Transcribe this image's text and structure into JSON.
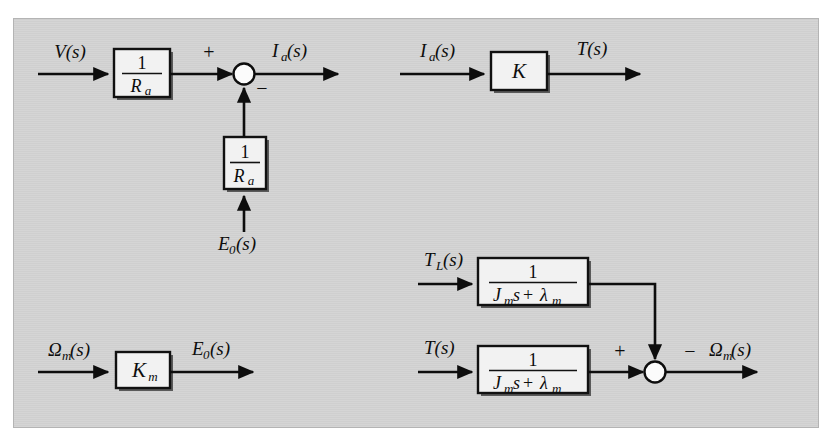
{
  "figure": {
    "type": "block-diagram",
    "domain": "control-systems",
    "background_color": "#d2d2d2",
    "page_color": "#ffffff",
    "line_color": "#0d0d0d",
    "block_fill": "#f2f2f2"
  },
  "subdiagrams": [
    {
      "id": "armature-circuit",
      "input_label": "V(s)",
      "block_label": "1 / R_a",
      "output_label": "I_a(s)",
      "feedback_label": "E_0(s)"
    },
    {
      "id": "torque-gain",
      "input_label": "I_a(s)",
      "block_label": "K",
      "output_label": "T(s)"
    },
    {
      "id": "back-emf",
      "input_label": "Omega_m(s)",
      "block_label": "K_m",
      "output_label": "E_0(s)"
    },
    {
      "id": "mechanical-load",
      "input_label_top": "T_L(s)",
      "input_label_bottom": "T(s)",
      "block_label": "1 / (J_m s + lambda_m)",
      "output_label": "Omega_m(s)"
    }
  ],
  "labels": {
    "v_s": "V(s)",
    "ia_s_out": "I",
    "ia_sub": "a",
    "ia_paren": "(s)",
    "ia_s_in": "I",
    "e0_feedback": "E",
    "e0_sub": "0",
    "e0_paren": "(s)",
    "t_s": "T(s)",
    "tl_main": "T",
    "tl_sub": "L",
    "tl_paren": "(s)",
    "omega_main": "Ω",
    "omega_sub": "m",
    "omega_paren": "(s)",
    "k_gain": "K",
    "km_main": "K",
    "km_sub": "m",
    "one": "1",
    "ra_main": "R",
    "ra_sub": "a",
    "jm_main": "J",
    "jm_sub": "m",
    "s_var": "s",
    "plus_op": "+",
    "lambda_main": "λ",
    "lambda_sub": "m",
    "plus_sign": "+",
    "minus_sign": "−"
  },
  "summing_junctions": [
    {
      "id": "junction-armature",
      "position": {
        "x": 244,
        "y": 74
      },
      "inputs": [
        {
          "from": "left",
          "sign": "+"
        },
        {
          "from": "below",
          "sign": "−"
        }
      ],
      "output": "I_a(s)"
    },
    {
      "id": "junction-speed",
      "position": {
        "x": 655,
        "y": 372
      },
      "inputs": [
        {
          "from": "left",
          "sign": "+"
        },
        {
          "from": "above",
          "sign": "−"
        }
      ],
      "output": "Omega_m(s)"
    }
  ]
}
